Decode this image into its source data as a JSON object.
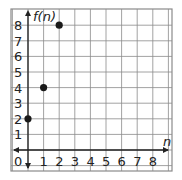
{
  "chart_data": {
    "type": "scatter",
    "title": "",
    "xlabel": "n",
    "ylabel": "f(n)",
    "x_ticks": [
      "1",
      "2",
      "3",
      "4",
      "5",
      "6",
      "7",
      "8"
    ],
    "y_ticks": [
      "1",
      "2",
      "3",
      "4",
      "5",
      "6",
      "7",
      "8"
    ],
    "origin_label": "0",
    "xlim": [
      0,
      8
    ],
    "ylim": [
      0,
      8
    ],
    "grid": true,
    "series": [
      {
        "name": "f(n)",
        "points": [
          [
            0,
            2
          ],
          [
            1,
            4
          ],
          [
            2,
            8
          ]
        ]
      }
    ],
    "colors": {
      "grid": "#8a8a8a",
      "axis": "#222222",
      "points": "#1a1a1a"
    }
  }
}
